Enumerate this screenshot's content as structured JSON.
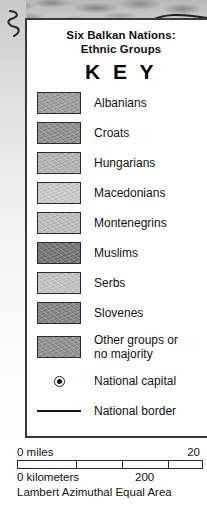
{
  "map": {
    "backdrop_name": "balkans-relief-map",
    "ink_color": "#1a1a1a"
  },
  "key": {
    "title_line1": "Six Balkan Nations:",
    "title_line2": "Ethnic Groups",
    "heading": "K E Y",
    "entries": [
      {
        "label": "Albanians",
        "color": "#9a9a9a",
        "type": "swatch"
      },
      {
        "label": "Croats",
        "color": "#8b8b8b",
        "type": "swatch"
      },
      {
        "label": "Hungarians",
        "color": "#b2b2b2",
        "type": "swatch"
      },
      {
        "label": "Macedonians",
        "color": "#c9c9c9",
        "type": "swatch"
      },
      {
        "label": "Montenegrins",
        "color": "#bcbcbc",
        "type": "swatch"
      },
      {
        "label": "Muslims",
        "color": "#6e6e6e",
        "type": "swatch"
      },
      {
        "label": "Serbs",
        "color": "#c2c2c2",
        "type": "swatch"
      },
      {
        "label": "Slovenes",
        "color": "#7f7f7f",
        "type": "swatch"
      }
    ],
    "other_entry": {
      "label_line1": "Other groups or",
      "label_line2": "no majority",
      "color": "#8c8c8c"
    },
    "symbols": [
      {
        "label": "National capital",
        "icon": "capital-bullseye-icon"
      },
      {
        "label": "National border",
        "icon": "border-line-icon"
      }
    ]
  },
  "scale": {
    "miles_zero": "0 miles",
    "miles_max": "20",
    "km_zero": "0 kilometers",
    "km_mid": "200",
    "projection": "Lambert Azimuthal Equal Area"
  }
}
